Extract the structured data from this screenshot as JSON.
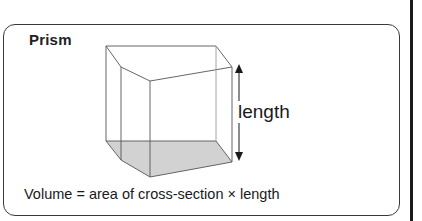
{
  "title": "Prism",
  "labels": {
    "length": "length",
    "formula": "Volume = area of cross-section × length"
  },
  "colors": {
    "frame_border": "#3a3a3a",
    "edge_line": "#555555",
    "cross_section_fill": "#cfcfcf",
    "text": "#1a1a1a",
    "right_rule": "#1a1a1a"
  },
  "prism": {
    "shape": "pentagonal prism",
    "top_face": [
      [
        106,
        46
      ],
      [
        216,
        46
      ],
      [
        232,
        67
      ],
      [
        150,
        81
      ],
      [
        121,
        67
      ]
    ],
    "bottom_face_shaded": [
      [
        106,
        141
      ],
      [
        216,
        141
      ],
      [
        232,
        162
      ],
      [
        150,
        177
      ],
      [
        121,
        160
      ]
    ],
    "length_arrow": {
      "x": 238,
      "y_start": 65,
      "y_end": 160,
      "direction": "double-headed vertical"
    }
  }
}
